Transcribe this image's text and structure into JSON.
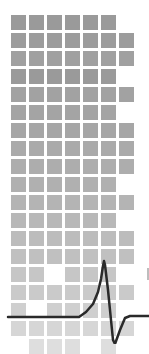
{
  "illustration": {
    "name": "signal-grid-illustration",
    "grid": {
      "origin_x": 11,
      "origin_y": 15,
      "pitch": 18,
      "cell_size": 15,
      "rows": [
        {
          "cols": [
            1,
            2,
            3,
            4,
            5,
            6
          ],
          "color": "#9a9a9a"
        },
        {
          "cols": [
            1,
            2,
            3,
            4,
            5,
            6,
            7
          ],
          "color": "#9c9c9c"
        },
        {
          "cols": [
            1,
            2,
            3,
            4,
            5,
            6,
            7
          ],
          "color": "#a0a0a0"
        },
        {
          "cols": [
            1,
            2,
            3,
            4,
            5,
            6
          ],
          "color": "#9a9a9a"
        },
        {
          "cols": [
            1,
            2,
            3,
            4,
            5,
            6,
            7
          ],
          "color": "#a2a2a2"
        },
        {
          "cols": [
            1,
            2,
            3,
            4,
            5,
            6
          ],
          "color": "#a4a4a4"
        },
        {
          "cols": [
            1,
            2,
            3,
            4,
            5,
            6,
            7
          ],
          "color": "#a6a6a6"
        },
        {
          "cols": [
            1,
            2,
            3,
            4,
            5,
            6,
            7
          ],
          "color": "#aaaaaa"
        },
        {
          "cols": [
            1,
            2,
            3,
            4,
            5,
            6,
            7
          ],
          "color": "#adadad"
        },
        {
          "cols": [
            1,
            2,
            3,
            4,
            5,
            6
          ],
          "color": "#b0b0b0"
        },
        {
          "cols": [
            1,
            2,
            3,
            4,
            5,
            6,
            7
          ],
          "color": "#b4b4b4"
        },
        {
          "cols": [
            1,
            2,
            3,
            4,
            5,
            6
          ],
          "color": "#b8b8b8"
        },
        {
          "cols": [
            1,
            2,
            3,
            4,
            5,
            6,
            7
          ],
          "color": "#bcbcbc"
        },
        {
          "cols": [
            1,
            2,
            3,
            4,
            5,
            6,
            7
          ],
          "color": "#c0c0c0"
        },
        {
          "cols": [
            1,
            2,
            4,
            5,
            6
          ],
          "color": "#c6c6c6"
        },
        {
          "cols": [
            1,
            2,
            3,
            4,
            5,
            6,
            7
          ],
          "color": "#cacaca"
        },
        {
          "cols": [
            1,
            3,
            4,
            5,
            6
          ],
          "color": "#cfcfcf"
        },
        {
          "cols": [
            1,
            2,
            3,
            4,
            5,
            6,
            7
          ],
          "color": "#d6d6d6"
        },
        {
          "cols": [
            2,
            3,
            4,
            6
          ],
          "color": "#dedede"
        }
      ]
    },
    "waveform": {
      "name": "action-potential-trace",
      "stroke": "#2a2a2a",
      "stroke_width": 2.5,
      "points": "8,317 79,317 86,312 93,304 98,292 101,279 103,266 104,261 105,265 108,290 111,320 113,340 115,344 120,330 125,318 130,316 149,316"
    }
  }
}
